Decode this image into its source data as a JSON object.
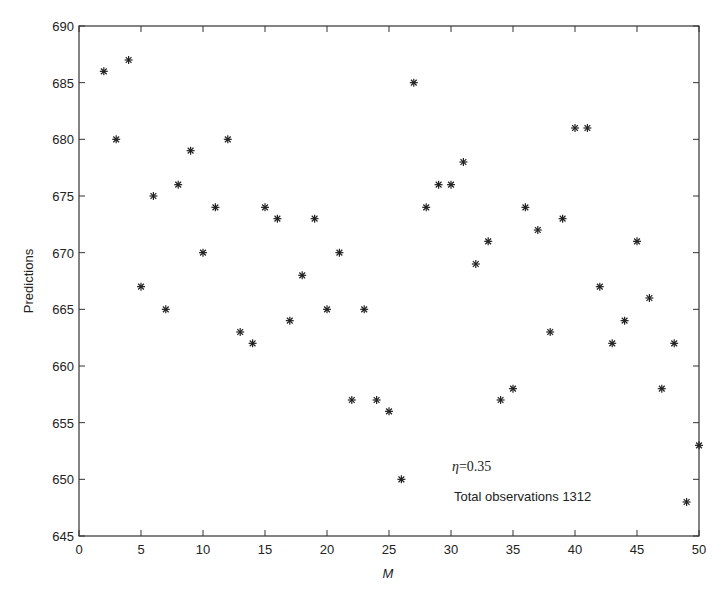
{
  "chart_data": {
    "type": "scatter",
    "title": "",
    "xlabel": "M",
    "ylabel": "Predictions",
    "xlim": [
      0,
      50
    ],
    "ylim": [
      645,
      690
    ],
    "xticks": [
      0,
      5,
      10,
      15,
      20,
      25,
      30,
      35,
      40,
      45,
      50
    ],
    "yticks": [
      645,
      650,
      655,
      660,
      665,
      670,
      675,
      680,
      685,
      690
    ],
    "grid": false,
    "legend": null,
    "marker": "asterisk",
    "series": [
      {
        "name": "Predictions",
        "x": [
          2,
          3,
          4,
          5,
          6,
          7,
          8,
          9,
          10,
          11,
          12,
          13,
          14,
          15,
          16,
          17,
          18,
          19,
          20,
          21,
          22,
          23,
          24,
          25,
          26,
          27,
          28,
          29,
          30,
          31,
          32,
          33,
          34,
          35,
          36,
          37,
          38,
          39,
          40,
          41,
          42,
          43,
          44,
          45,
          46,
          47,
          48,
          49,
          50
        ],
        "y": [
          686,
          680,
          687,
          667,
          675,
          665,
          676,
          679,
          670,
          674,
          680,
          663,
          662,
          674,
          673,
          664,
          668,
          673,
          665,
          670,
          657,
          665,
          657,
          656,
          650,
          685,
          674,
          676,
          676,
          678,
          669,
          671,
          657,
          658,
          674,
          672,
          663,
          673,
          681,
          681,
          667,
          662,
          664,
          671,
          666,
          658,
          662,
          648,
          653
        ]
      }
    ],
    "annotations": [
      {
        "text_symbol": "η",
        "text_value": "=0.35",
        "x": 30.5,
        "y": 651
      },
      {
        "text": "Total observations 1312",
        "x": 30.5,
        "y": 648
      }
    ]
  }
}
